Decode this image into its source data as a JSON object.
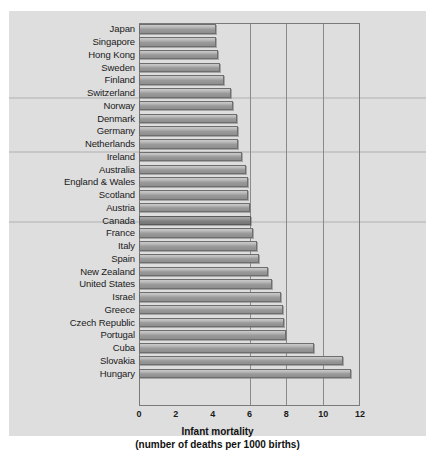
{
  "chart_data": {
    "type": "bar",
    "orientation": "horizontal",
    "title": "",
    "xlabel_line1": "Infant mortality",
    "xlabel_line2": "(number of deaths per 1000 births)",
    "ylabel": "",
    "xlim": [
      0,
      12
    ],
    "xticks": [
      0,
      2,
      4,
      6,
      8,
      12
    ],
    "xtick_labels": [
      "0",
      "2",
      "4",
      "6",
      "8",
      "10",
      "12"
    ],
    "gridlines_at": [
      6,
      8,
      10
    ],
    "grid": true,
    "legend": "none",
    "highlight_category": "Canada",
    "categories": [
      "Japan",
      "Singapore",
      "Hong Kong",
      "Sweden",
      "Finland",
      "Switzerland",
      "Norway",
      "Denmark",
      "Germany",
      "Netherlands",
      "Ireland",
      "Australia",
      "England & Wales",
      "Scotland",
      "Austria",
      "Canada",
      "France",
      "Italy",
      "Spain",
      "New Zealand",
      "United States",
      "Israel",
      "Greece",
      "Czech Republic",
      "Portugal",
      "Cuba",
      "Slovakia",
      "Hungary"
    ],
    "values": [
      4.2,
      4.2,
      4.3,
      4.4,
      4.6,
      5.0,
      5.1,
      5.3,
      5.4,
      5.4,
      5.6,
      5.8,
      5.9,
      5.9,
      6.0,
      6.1,
      6.2,
      6.4,
      6.5,
      7.0,
      7.2,
      7.7,
      7.8,
      7.9,
      8.0,
      9.5,
      11.1,
      11.5
    ],
    "value_unit": "deaths per 1000 births"
  },
  "colors": {
    "panel_background": "#dedede",
    "bar_fill": "#aaaaaa",
    "bar_highlight_fill": "#8a8a8a",
    "bar_border": "#6e6e6e",
    "frame": "#7a7a7a",
    "gridline": "#8a8a8a",
    "text": "#1a1a1a"
  }
}
